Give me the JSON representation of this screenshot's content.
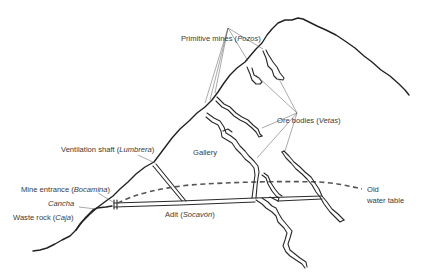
{
  "diagram": {
    "colors": {
      "line": "#222222",
      "text": "#3a3a3a",
      "leader": "#555555",
      "background": "#ffffff"
    },
    "labels": {
      "primitive_mines": {
        "text": "Primitive mines (",
        "italic": "Pozos",
        "suffix": ")"
      },
      "ore_bodies": {
        "text": "Ore bodies (",
        "italic": "Vetas",
        "suffix": ")"
      },
      "ventilation_shaft": {
        "text": "Ventilation shaft (",
        "italic": "Lumbrera",
        "suffix": ")"
      },
      "gallery": {
        "text": "Gallery"
      },
      "mine_entrance": {
        "text": "Mine entrance (",
        "italic": "Bocamina",
        "suffix": ")"
      },
      "cancha": {
        "italic": "Cancha"
      },
      "waste_rock": {
        "text": "Waste rock (",
        "italic": "Caja",
        "suffix": ")"
      },
      "adit": {
        "text": "Adit (",
        "italic": "Socavón",
        "suffix": ")"
      },
      "water_table_line1": {
        "text": "Old"
      },
      "water_table_line2": {
        "text": "water table"
      }
    }
  }
}
